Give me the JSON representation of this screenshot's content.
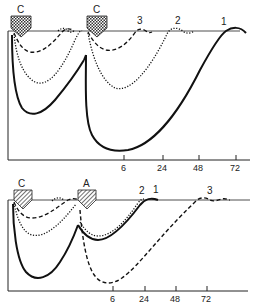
{
  "panels": [
    {
      "id": "top",
      "markers": [
        {
          "label": "C",
          "type": "crosshatch",
          "x": 20
        },
        {
          "label": "C",
          "type": "crosshatch",
          "x": 96
        }
      ],
      "curve_labels": [
        "3",
        "2",
        "1"
      ],
      "x_ticks": [
        "6",
        "24",
        "48",
        "72"
      ]
    },
    {
      "id": "bottom",
      "markers": [
        {
          "label": "C",
          "type": "crosshatch",
          "x": 20
        },
        {
          "label": "A",
          "type": "hatch",
          "x": 87
        }
      ],
      "curve_labels": [
        "2",
        "1",
        "3"
      ],
      "x_ticks": [
        "6",
        "24",
        "48",
        "72"
      ]
    }
  ],
  "legend": {
    "line_styles": {
      "1": "solid",
      "2": "dotted",
      "3": "dashed"
    }
  }
}
